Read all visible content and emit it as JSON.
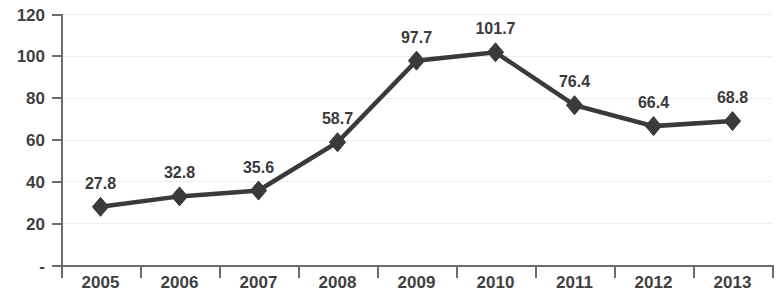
{
  "chart_data": {
    "type": "line",
    "title": "",
    "subtitle": "",
    "xlabel": "",
    "ylabel": "",
    "categories": [
      "2005",
      "2006",
      "2007",
      "2008",
      "2009",
      "2010",
      "2011",
      "2012",
      "2013"
    ],
    "values": [
      27.8,
      32.8,
      35.6,
      58.7,
      97.7,
      101.7,
      76.4,
      66.4,
      68.8
    ],
    "data_labels": [
      "27.8",
      "32.8",
      "35.6",
      "58.7",
      "97.7",
      "101.7",
      "76.4",
      "66.4",
      "68.8"
    ],
    "series": [
      {
        "name": "",
        "values": [
          27.8,
          32.8,
          35.6,
          58.7,
          97.7,
          101.7,
          76.4,
          66.4,
          68.8
        ]
      }
    ],
    "ylim": [
      0,
      120
    ],
    "y_ticks": [
      0,
      20,
      40,
      60,
      80,
      100,
      120
    ],
    "y_tick_labels": [
      "-",
      "20",
      "40",
      "60",
      "80",
      "100",
      "120"
    ],
    "grid": true,
    "grid_axis": "y",
    "legend": false,
    "legend_position": "none",
    "marker": "diamond",
    "colors": {
      "line": "#3a3a3a",
      "marker": "#3a3a3a",
      "grid": "#ededed",
      "axis": "#6b6b6b",
      "label_text": "#3a3a3a",
      "tick_text": "#3f3f3f",
      "background": "#ffffff"
    }
  }
}
